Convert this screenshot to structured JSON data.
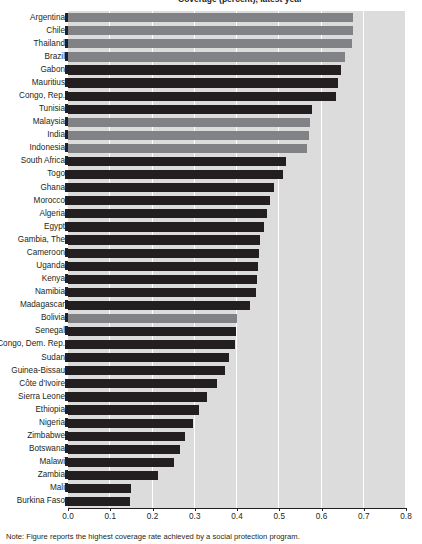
{
  "figure": {
    "title_clipped": "Coverage (percent), latest year",
    "footnote_clipped": "Note: Figure reports the highest coverage rate achieved by a social protection program."
  },
  "chart_data": {
    "type": "bar",
    "orientation": "horizontal",
    "title": "Coverage (percent), latest year",
    "xlabel": "",
    "ylabel": "",
    "xlim": [
      0.0,
      0.8
    ],
    "xticks": [
      0.0,
      0.1,
      0.2,
      0.3,
      0.4,
      0.5,
      0.6,
      0.7,
      0.8
    ],
    "xtick_labels": [
      "0.0",
      "0.1",
      "0.2",
      "0.3",
      "0.4",
      "0.5",
      "0.6",
      "0.7",
      "0.8"
    ],
    "grid": true,
    "legend": null,
    "series_colors": {
      "dark": "#231f20",
      "light": "#808285"
    },
    "categories": [
      "Argentina",
      "Chile",
      "Thailand",
      "Brazil",
      "Gabon",
      "Mauritius",
      "Congo, Rep.",
      "Tunisia",
      "Malaysia",
      "India",
      "Indonesia",
      "South Africa",
      "Togo",
      "Ghana",
      "Morocco",
      "Algeria",
      "Egypt",
      "Gambia, The",
      "Cameroon",
      "Uganda",
      "Kenya",
      "Namibia",
      "Madagascar",
      "Bolivia",
      "Senegal",
      "Congo, Dem. Rep.",
      "Sudan",
      "Guinea-Bissau",
      "Côte d'Ivoire",
      "Sierra Leone",
      "Ethiopia",
      "Nigeria",
      "Zimbabwe",
      "Botswana",
      "Malawi",
      "Zambia",
      "Mali",
      "Burkina Faso"
    ],
    "values": [
      0.675,
      0.675,
      0.673,
      0.655,
      0.645,
      0.64,
      0.635,
      0.578,
      0.573,
      0.57,
      0.565,
      0.516,
      0.508,
      0.487,
      0.479,
      0.472,
      0.465,
      0.455,
      0.452,
      0.45,
      0.448,
      0.445,
      0.43,
      0.4,
      0.398,
      0.395,
      0.382,
      0.372,
      0.353,
      0.33,
      0.31,
      0.295,
      0.278,
      0.265,
      0.252,
      0.212,
      0.15,
      0.146
    ],
    "groups": [
      "light",
      "light",
      "light",
      "light",
      "dark",
      "dark",
      "dark",
      "dark",
      "light",
      "light",
      "light",
      "dark",
      "dark",
      "dark",
      "dark",
      "dark",
      "dark",
      "dark",
      "dark",
      "dark",
      "dark",
      "dark",
      "dark",
      "light",
      "dark",
      "dark",
      "dark",
      "dark",
      "dark",
      "dark",
      "dark",
      "dark",
      "dark",
      "dark",
      "dark",
      "dark",
      "dark",
      "dark"
    ]
  }
}
